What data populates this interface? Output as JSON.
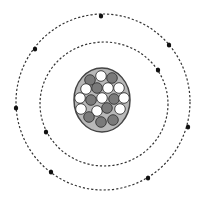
{
  "diagram": {
    "type": "atom-model",
    "colors": {
      "orbit": "#333333",
      "electron": "#111111",
      "nucleus_fill": "#b8b8b8",
      "nucleus_stroke": "#444444",
      "proton": "#7a7a7a",
      "neutron": "#ffffff",
      "particle_stroke": "#333333"
    },
    "orbits": [
      {
        "name": "inner-orbit",
        "cx": 104,
        "cy": 104,
        "rx": 64,
        "ry": 62
      },
      {
        "name": "outer-orbit",
        "cx": 103,
        "cy": 102,
        "rx": 87,
        "ry": 88
      }
    ],
    "electrons": [
      {
        "orbit": "inner",
        "x": 158,
        "y": 70
      },
      {
        "orbit": "inner",
        "x": 46,
        "y": 132
      },
      {
        "orbit": "outer",
        "x": 101,
        "y": 16
      },
      {
        "orbit": "outer",
        "x": 169,
        "y": 45
      },
      {
        "orbit": "outer",
        "x": 35,
        "y": 49
      },
      {
        "orbit": "outer",
        "x": 16,
        "y": 108
      },
      {
        "orbit": "outer",
        "x": 188,
        "y": 127
      },
      {
        "orbit": "outer",
        "x": 51,
        "y": 172
      },
      {
        "orbit": "outer",
        "x": 148,
        "y": 178
      }
    ],
    "nucleus": {
      "cx": 102,
      "cy": 100,
      "rx": 28,
      "ry": 32,
      "particles": [
        {
          "kind": "proton",
          "x": 90,
          "y": 80
        },
        {
          "kind": "neutron",
          "x": 101,
          "y": 76
        },
        {
          "kind": "proton",
          "x": 112,
          "y": 78
        },
        {
          "kind": "neutron",
          "x": 86,
          "y": 89
        },
        {
          "kind": "proton",
          "x": 97,
          "y": 88
        },
        {
          "kind": "neutron",
          "x": 108,
          "y": 88
        },
        {
          "kind": "neutron",
          "x": 119,
          "y": 88
        },
        {
          "kind": "neutron",
          "x": 80,
          "y": 98
        },
        {
          "kind": "proton",
          "x": 91,
          "y": 100
        },
        {
          "kind": "neutron",
          "x": 102,
          "y": 98
        },
        {
          "kind": "proton",
          "x": 114,
          "y": 99
        },
        {
          "kind": "neutron",
          "x": 124,
          "y": 98
        },
        {
          "kind": "neutron",
          "x": 81,
          "y": 109
        },
        {
          "kind": "neutron",
          "x": 97,
          "y": 111
        },
        {
          "kind": "proton",
          "x": 107,
          "y": 108
        },
        {
          "kind": "neutron",
          "x": 120,
          "y": 109
        },
        {
          "kind": "proton",
          "x": 89,
          "y": 117
        },
        {
          "kind": "proton",
          "x": 101,
          "y": 122
        },
        {
          "kind": "proton",
          "x": 113,
          "y": 120
        }
      ]
    },
    "counts": {
      "electrons": 9,
      "protons": 9,
      "neutrons": 10
    }
  }
}
